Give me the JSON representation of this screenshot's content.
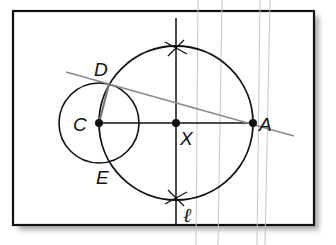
{
  "diagram": {
    "type": "geometric-construction",
    "title": "",
    "points": [
      {
        "id": "C",
        "label": "C",
        "x": 99,
        "y": 123
      },
      {
        "id": "X",
        "label": "X",
        "x": 176,
        "y": 123
      },
      {
        "id": "A",
        "label": "A",
        "x": 253,
        "y": 123
      },
      {
        "id": "D",
        "label": "D",
        "x": 109,
        "y": 84
      },
      {
        "id": "E",
        "label": "E",
        "x": 109,
        "y": 162
      }
    ],
    "line_label": "ℓ",
    "labels": {
      "C": "C",
      "X": "X",
      "A": "A",
      "D": "D",
      "E": "E",
      "l": "ℓ"
    },
    "circles": [
      {
        "id": "circle-C",
        "center": "C",
        "radius": 40
      },
      {
        "id": "circle-X",
        "center": "X",
        "radius": 77
      }
    ],
    "segments": [
      {
        "from": "C",
        "to": "A",
        "style": "solid-black"
      },
      {
        "from": "C",
        "to": "D",
        "style": "gray"
      }
    ],
    "lines": [
      {
        "id": "l",
        "type": "perpendicular-bisector",
        "through": "X",
        "orientation": "vertical"
      },
      {
        "id": "tangent-AD",
        "through": [
          "D",
          "A"
        ],
        "style": "gray"
      }
    ],
    "colors": {
      "ink": "#111111",
      "gray_line": "#8a8a8a",
      "faint_line": "#c4c4c4",
      "frame": "#111111",
      "shadow": "#9a9a9a"
    }
  }
}
